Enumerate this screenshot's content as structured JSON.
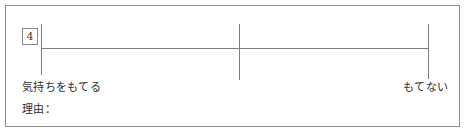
{
  "form": {
    "question_number": "4",
    "scale": {
      "left_anchor_label": "気持ちをもてる",
      "right_anchor_label": "もてない",
      "tick_count": 3
    },
    "reason_label": "理由："
  },
  "colors": {
    "background": "#ffffff",
    "frame_border": "#8e8e8e",
    "rule_line": "#7d7d7d",
    "text": "#2e2e2e"
  }
}
